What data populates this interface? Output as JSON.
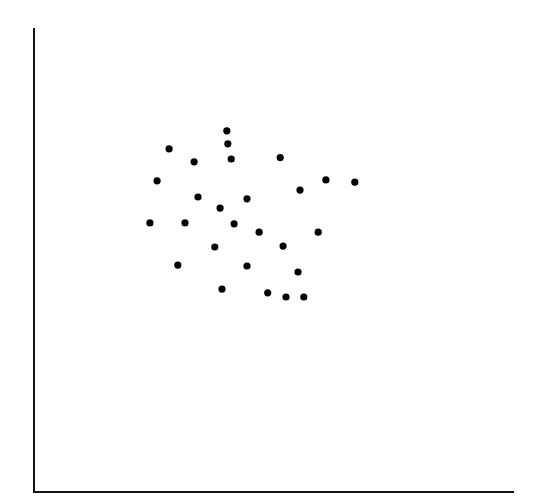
{
  "chart_data": {
    "type": "scatter",
    "title": "",
    "xlabel": "",
    "ylabel": "",
    "xlim": [
      0,
      100
    ],
    "ylim": [
      0,
      100
    ],
    "grid": false,
    "legend": null,
    "series": [
      {
        "name": "points",
        "color": "#000000",
        "points": [
          [
            40.3,
            77.8
          ],
          [
            40.5,
            75.0
          ],
          [
            41.2,
            71.7
          ],
          [
            28.3,
            73.9
          ],
          [
            33.5,
            71.1
          ],
          [
            51.4,
            72.0
          ],
          [
            25.8,
            67.0
          ],
          [
            60.9,
            67.2
          ],
          [
            66.9,
            66.7
          ],
          [
            55.5,
            65.0
          ],
          [
            34.3,
            63.5
          ],
          [
            44.5,
            63.1
          ],
          [
            38.9,
            61.1
          ],
          [
            24.3,
            57.9
          ],
          [
            31.6,
            57.9
          ],
          [
            41.8,
            57.7
          ],
          [
            47.0,
            55.9
          ],
          [
            59.3,
            55.9
          ],
          [
            37.8,
            52.7
          ],
          [
            52.0,
            52.9
          ],
          [
            30.1,
            48.8
          ],
          [
            44.5,
            48.6
          ],
          [
            55.1,
            47.3
          ],
          [
            39.3,
            43.6
          ],
          [
            48.8,
            42.8
          ],
          [
            52.6,
            41.9
          ],
          [
            56.3,
            41.9
          ]
        ]
      }
    ]
  },
  "plot_area": {
    "left": 33,
    "right": 514,
    "top": 28,
    "bottom": 491
  }
}
